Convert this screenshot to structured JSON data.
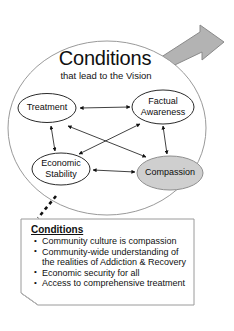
{
  "slide": {
    "title": "Conditions",
    "subtitle": "that lead to the Vision"
  },
  "colors": {
    "background": "#ffffff",
    "outline": "#8c8c8c",
    "node_outline": "#2b2b2b",
    "arrow": "#111111",
    "compassion_fill": "#cfcfcf",
    "big_arrow_fill": "#b3b3b3",
    "big_arrow_outline": "#8a8a8a",
    "text": "#101010",
    "callout_border": "#9a9a9a"
  },
  "diagram": {
    "type": "cycle-of-conditions",
    "big_arrow": "right-block-arrow",
    "nodes": [
      {
        "id": "treatment",
        "label": "Treatment",
        "fill": "#ffffff",
        "position": "top-left"
      },
      {
        "id": "factual",
        "label": "Factual\nAwareness",
        "fill": "#ffffff",
        "position": "top-right"
      },
      {
        "id": "economic",
        "label": "Economic\nStability",
        "fill": "#ffffff",
        "position": "bottom-left"
      },
      {
        "id": "compassion",
        "label": "Compassion",
        "fill": "#cfcfcf",
        "position": "bottom-right"
      }
    ],
    "connections": [
      {
        "from": "treatment",
        "to": "factual",
        "style": "double-headed"
      },
      {
        "from": "economic",
        "to": "compassion",
        "style": "double-headed"
      },
      {
        "from": "treatment",
        "to": "economic",
        "style": "double-headed"
      },
      {
        "from": "factual",
        "to": "compassion",
        "style": "double-headed"
      },
      {
        "from": "treatment",
        "to": "compassion",
        "style": "double-headed"
      },
      {
        "from": "factual",
        "to": "economic",
        "style": "double-headed"
      }
    ],
    "leader_line": "dashed"
  },
  "callout": {
    "heading": "Conditions",
    "bullets": [
      "Community culture is compassion",
      "Community-wide understanding of the realities of Addiction & Recovery",
      "Economic security for all",
      "Access to comprehensive treatment"
    ]
  }
}
